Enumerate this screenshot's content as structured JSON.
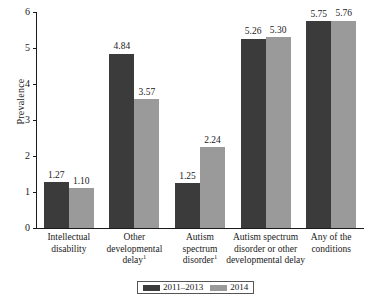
{
  "chart_data": {
    "type": "bar",
    "title": "",
    "xlabel": "",
    "ylabel": "Prevalence",
    "ylim": [
      0,
      6
    ],
    "yticks": [
      0,
      1,
      2,
      3,
      4,
      5,
      6
    ],
    "grid": false,
    "legend_position": "bottom",
    "categories": [
      "Intellectual disability",
      "Other developmental delay¹",
      "Autism spectrum disorder¹",
      "Autism spectrum disorder or other developmental delay",
      "Any of the conditions"
    ],
    "category_lines": [
      [
        "Intellectual",
        "disability"
      ],
      [
        "Other",
        "developmental",
        "delay"
      ],
      [
        "Autism",
        "spectrum",
        "disorder"
      ],
      [
        "Autism spectrum",
        "disorder or other",
        "developmental delay"
      ],
      [
        "Any of the",
        "conditions"
      ]
    ],
    "category_footnotes": [
      "",
      "1",
      "1",
      "",
      ""
    ],
    "series": [
      {
        "name": "2011–2013",
        "color": "#3b3b3b",
        "values": [
          1.27,
          4.84,
          1.25,
          5.26,
          5.75
        ]
      },
      {
        "name": "2014",
        "color": "#9a9a9a",
        "values": [
          1.1,
          3.57,
          2.24,
          5.3,
          5.76
        ]
      }
    ],
    "value_labels": [
      [
        "1.27",
        "1.10"
      ],
      [
        "4.84",
        "3.57"
      ],
      [
        "1.25",
        "2.24"
      ],
      [
        "5.26",
        "5.30"
      ],
      [
        "5.75",
        "5.76"
      ]
    ]
  },
  "axis": {
    "y_label": "Prevalence",
    "y_tick_labels": [
      "0",
      "1",
      "2",
      "3",
      "4",
      "5",
      "6"
    ]
  },
  "legend": {
    "items": [
      {
        "label": "2011–2013",
        "color": "#3b3b3b"
      },
      {
        "label": "2014",
        "color": "#9a9a9a"
      }
    ]
  },
  "colors": {
    "series_1": "#3b3b3b",
    "series_2": "#9a9a9a",
    "axis": "#1a1a1a",
    "background": "#ffffff"
  }
}
